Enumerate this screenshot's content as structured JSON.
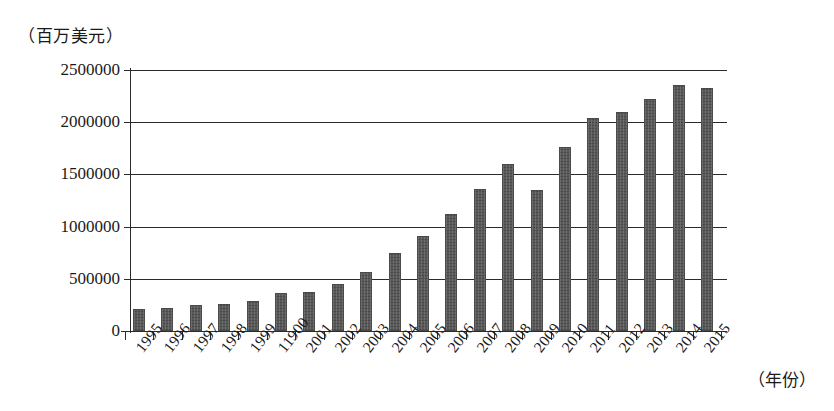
{
  "chart_data": {
    "type": "bar",
    "title": "",
    "ylabel": "（百万美元）",
    "xlabel": "（年份）",
    "ylim": [
      0,
      2500000
    ],
    "ytick_labels": [
      "0",
      "500000",
      "1000000",
      "1500000",
      "2000000",
      "2500000"
    ],
    "ytick_values": [
      0,
      500000,
      1000000,
      1500000,
      2000000,
      2500000
    ],
    "grid": true,
    "legend": "none",
    "categories": [
      "1995",
      "1996",
      "1997",
      "1998",
      "1999",
      "11900",
      "2001",
      "2002",
      "2003",
      "2004",
      "2005",
      "2006",
      "2007",
      "2008",
      "2009",
      "2010",
      "2011",
      "2012",
      "2013",
      "2014",
      "2015"
    ],
    "values": [
      215000,
      222000,
      251000,
      260000,
      289000,
      366000,
      376000,
      450000,
      570000,
      745000,
      910000,
      1120000,
      1365000,
      1600000,
      1355000,
      1760000,
      2045000,
      2095000,
      2220000,
      2355000,
      2325000
    ],
    "bar_color": "#595959"
  },
  "axis": {
    "y_unit": "（百万美元）",
    "x_unit": "（年份）"
  }
}
